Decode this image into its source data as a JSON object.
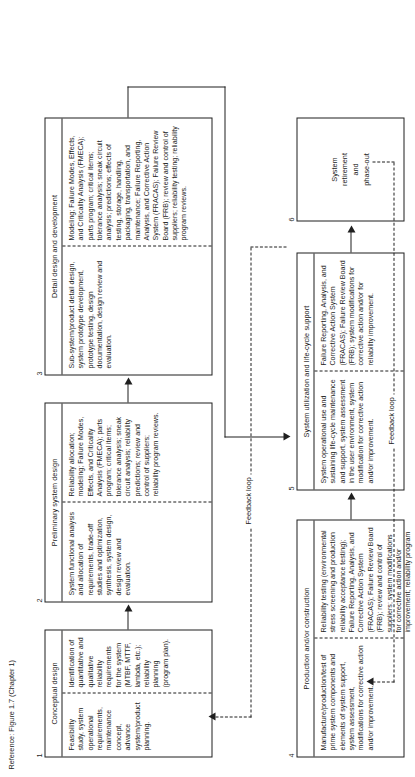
{
  "figure": {
    "reference_note": "Reference: Figure 1.7 (Chapter 1)",
    "orientation": "rotated-90-ccw",
    "accent_color": "#1f1f1f",
    "background_color": "#ffffff"
  },
  "boxes": [
    {
      "number": "1",
      "title": "Conceptual design",
      "top_text": "Feasibility study, system operational requirements, maintenance concept, advance system/product planning.",
      "bottom_text": "Identification of quantitative and qualitative reliability requirements for the system (MTBF, MTTF, lambda, etc.); reliability planning (program plan)."
    },
    {
      "number": "2",
      "title": "Preliminary system design",
      "top_text": "System functional analysis and allocation of requirements, trade-off studies and optimization, synthesis, system design, design review and evaluation.",
      "bottom_text": "Reliability allocation; modeling; Failure Modes, Effects, and Criticality Analysis (FMECA); parts program; critical items; tolerance analysis; sneak circuit analysis; reliability predictions; review and control of suppliers; reliability program reviews."
    },
    {
      "number": "3",
      "title": "Detail design and development",
      "top_text": "Sub-system/product detail design, system prototype development, prototype testing, design documentation, design review and evaluation.",
      "bottom_text": "Modeling; Failure Modes, Effects, and Criticality Analysis (FMECA); parts program; critical items; tolerance analysis; sneak circuit analysis; predictions; effects of testing, storage, handling, packaging, transportation, and maintenance; Failure Reporting, Analysis, and Corrective Action System (FRACAS); Failure Review Board (FRB); review and control of suppliers; reliability testing; reliability program reviews."
    },
    {
      "number": "4",
      "title": "Production and/or construction",
      "top_text": "Manufacture/production/test of prime system components and elements of system support, system assessment, modifications for corrective action and/or improvement.",
      "bottom_text": "Reliability testing (environmental stress screening and production reliability acceptance testing); Failure Reporting, Analysis, and Corrective Action System (FRACAS); Failure Review Board (FRB); review and control of suppliers; system modifications for corrective action and/or improvement; reliability program reviews."
    },
    {
      "number": "5",
      "title": "System utilization and life-cycle support",
      "top_text": "System operational use and sustaining life-cycle maintenance and support, system assessment in the user environment, system modification for corrective action and/or improvement.",
      "bottom_text": "Failure Reporting, Analysis, and Corrective Action System (FRACAS); Failure Review Board (FRB); system modifications for corrective action and/or for reliability improvement."
    }
  ],
  "terminal_box": {
    "number": "6",
    "line1": "System",
    "line2": "retirement",
    "line3": "and",
    "line4": "phase-out"
  },
  "feedback": {
    "label_upper": "Feedback loop",
    "label_lower": "Feedback loop"
  }
}
